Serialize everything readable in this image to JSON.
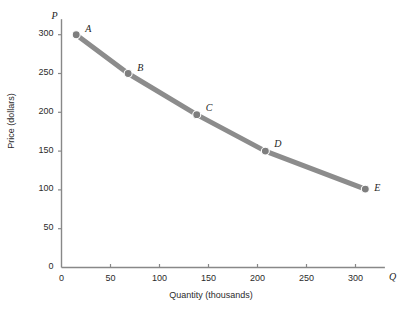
{
  "chart_data": {
    "type": "line",
    "title": "",
    "subtitle": "",
    "xlabel": "Quantity (thousands)",
    "ylabel": "Price (dollars)",
    "x_axis_symbol": "Q",
    "y_axis_symbol": "P",
    "xlim": [
      0,
      330
    ],
    "ylim": [
      0,
      320
    ],
    "xticks": [
      0,
      50,
      100,
      150,
      200,
      250,
      300
    ],
    "xtick_labels": [
      "0",
      "50",
      "100",
      "150",
      "200",
      "250",
      "300"
    ],
    "yticks": [
      0,
      50,
      100,
      150,
      200,
      250,
      300
    ],
    "ytick_labels": [
      "0",
      "50",
      "100",
      "150",
      "200",
      "250",
      "300"
    ],
    "grid": false,
    "legend": false,
    "line_color": "#8c8c8c",
    "axis_color": "#888888",
    "text_color": "#2b2b2b",
    "line_width": 5,
    "marker_size": 4,
    "series": [
      {
        "name": "Demand",
        "point_labels": [
          "A",
          "B",
          "C",
          "D",
          "E"
        ],
        "x": [
          15,
          68,
          138,
          208,
          310
        ],
        "y": [
          300,
          250,
          197,
          150,
          101
        ]
      }
    ],
    "annotations": [
      {
        "label": "A",
        "x": 15,
        "y": 300
      },
      {
        "label": "B",
        "x": 68,
        "y": 250
      },
      {
        "label": "C",
        "x": 138,
        "y": 197
      },
      {
        "label": "D",
        "x": 208,
        "y": 150
      },
      {
        "label": "E",
        "x": 310,
        "y": 101
      }
    ]
  }
}
